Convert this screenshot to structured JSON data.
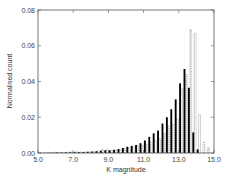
{
  "chart_data": {
    "type": "bar",
    "title": "",
    "xlabel": "K magnitude",
    "ylabel": "Normalised count",
    "xlim": [
      5.0,
      15.0
    ],
    "ylim": [
      0.0,
      0.08
    ],
    "xticks": [
      "5.0",
      "7.0",
      "9.0",
      "11.0",
      "13.0",
      "15.0"
    ],
    "yticks": [
      "0.00",
      "0.02",
      "0.04",
      "0.06",
      "0.08"
    ],
    "grid": false,
    "legend": null,
    "bin_width": 0.25,
    "x": [
      5.0,
      5.25,
      5.5,
      5.75,
      6.0,
      6.25,
      6.5,
      6.75,
      7.0,
      7.25,
      7.5,
      7.75,
      8.0,
      8.25,
      8.5,
      8.75,
      9.0,
      9.25,
      9.5,
      9.75,
      10.0,
      10.25,
      10.5,
      10.75,
      11.0,
      11.25,
      11.5,
      11.75,
      12.0,
      12.25,
      12.5,
      12.75,
      13.0,
      13.25,
      13.5,
      13.75,
      14.0,
      14.25,
      14.5,
      14.75
    ],
    "series": [
      {
        "name": "solid (black)",
        "style": "filled",
        "color": "#000000",
        "values": [
          0.0001,
          0.0001,
          0.0002,
          0.0002,
          0.0003,
          0.0003,
          0.0004,
          0.0004,
          0.0005,
          0.0005,
          0.0006,
          0.0007,
          0.0008,
          0.001,
          0.0013,
          0.0015,
          0.0015,
          0.0018,
          0.0022,
          0.0028,
          0.0035,
          0.004,
          0.0045,
          0.0055,
          0.007,
          0.009,
          0.011,
          0.0125,
          0.0165,
          0.02,
          0.0245,
          0.03,
          0.039,
          0.047,
          0.0365,
          0.0115,
          0.002,
          0.0,
          0.0,
          0.0
        ]
      },
      {
        "name": "dotted (outline)",
        "style": "hatched",
        "color": "#9a9a9a",
        "values": [
          0.0001,
          0.0001,
          0.0002,
          0.0002,
          0.0003,
          0.0003,
          0.0004,
          0.0006,
          0.0008,
          0.0006,
          0.0006,
          0.0007,
          0.0008,
          0.0012,
          0.002,
          0.0022,
          0.0014,
          0.0016,
          0.002,
          0.0025,
          0.003,
          0.0035,
          0.004,
          0.0045,
          0.005,
          0.006,
          0.007,
          0.008,
          0.011,
          0.015,
          0.016,
          0.019,
          0.036,
          0.044,
          0.069,
          0.067,
          0.0215,
          0.006,
          0.003,
          0.0
        ]
      }
    ]
  },
  "axes": {
    "xlabel": "K magnitude",
    "ylabel": "Normalised count",
    "xticks": [
      "5.0",
      "7.0",
      "9.0",
      "11.0",
      "13.0",
      "15.0"
    ],
    "yticks": [
      "0.00",
      "0.02",
      "0.04",
      "0.06",
      "0.08"
    ]
  }
}
